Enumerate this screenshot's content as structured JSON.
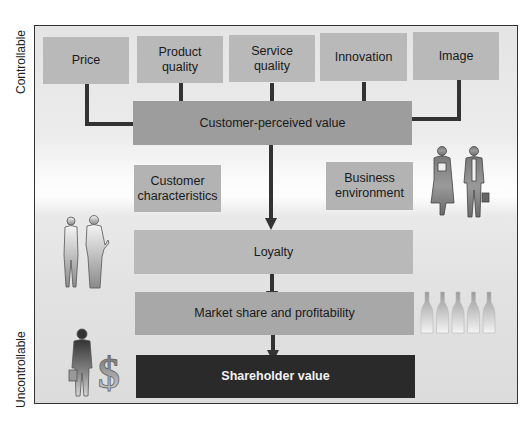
{
  "axis": {
    "top_label": "Controllable",
    "bottom_label": "Uncontrollable"
  },
  "drivers": [
    {
      "label": "Price"
    },
    {
      "label": "Product quality"
    },
    {
      "label": "Service quality"
    },
    {
      "label": "Innovation"
    },
    {
      "label": "Image"
    }
  ],
  "core": {
    "customer_perceived_value": "Customer-perceived value",
    "customer_characteristics": "Customer characteristics",
    "business_environment": "Business environment",
    "loyalty": "Loyalty",
    "market_share": "Market share and profitability",
    "shareholder_value": "Shareholder value"
  },
  "illustrations": {
    "left_people": "businesswoman-and-businessman-silhouettes",
    "right_people": "businesswoman-and-businessman-with-briefcase",
    "bottles": "five-bottles",
    "money": "businessman-with-dollar-sign"
  },
  "colors": {
    "driver_box": "#b9b9b9",
    "value_box": "#9d9d9d",
    "shareholder_box": "#2a2a2a",
    "connector": "#333333"
  }
}
